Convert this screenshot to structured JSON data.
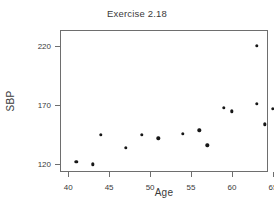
{
  "chart_data": {
    "type": "scatter",
    "title": "Exercise 2.18",
    "xlabel": "Age",
    "ylabel": "SBP",
    "xlim": [
      39.0,
      64.4
    ],
    "ylim": [
      113.6,
      233.6
    ],
    "grid": false,
    "legend": null,
    "xticks": [
      40,
      45,
      50,
      55,
      60,
      65
    ],
    "xtick_labels": [
      "40",
      "45",
      "50",
      "55",
      "60",
      "65"
    ],
    "yticks": [
      120,
      170,
      220
    ],
    "ytick_labels": [
      "120",
      "170",
      "220"
    ],
    "marker": "filled-circle",
    "marker_color": "#171717",
    "x": [
      41,
      43,
      44,
      47,
      49,
      51,
      54,
      56,
      57,
      59,
      60,
      63,
      63,
      64,
      65
    ],
    "y": [
      122,
      120,
      145,
      134,
      145,
      142,
      146,
      149,
      136,
      168,
      165,
      220,
      171,
      154,
      167
    ],
    "points": [
      {
        "x": 41,
        "y": 122
      },
      {
        "x": 43,
        "y": 120
      },
      {
        "x": 44,
        "y": 145
      },
      {
        "x": 47,
        "y": 134
      },
      {
        "x": 49,
        "y": 145
      },
      {
        "x": 51,
        "y": 142
      },
      {
        "x": 54,
        "y": 146
      },
      {
        "x": 56,
        "y": 149
      },
      {
        "x": 57,
        "y": 136
      },
      {
        "x": 59,
        "y": 168
      },
      {
        "x": 60,
        "y": 165
      },
      {
        "x": 63,
        "y": 220
      },
      {
        "x": 63,
        "y": 171
      },
      {
        "x": 64,
        "y": 154
      },
      {
        "x": 65,
        "y": 167
      }
    ]
  },
  "colors": {
    "axis": "#6e6e6e",
    "text": "#3a3a3a",
    "marker": "#171717",
    "background": "#ffffff"
  }
}
